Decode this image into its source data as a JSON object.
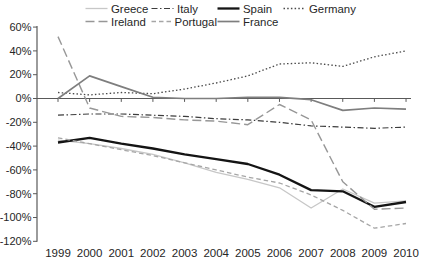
{
  "chart_data": {
    "type": "line",
    "title": "",
    "xlabel": "",
    "ylabel": "",
    "grid": false,
    "legend_position": "top",
    "ylim": [
      -120,
      60
    ],
    "y_ticks": [
      60,
      40,
      20,
      0,
      -20,
      -40,
      -60,
      -80,
      -100,
      -120
    ],
    "y_tick_suffix": "%",
    "x_categories": [
      1999,
      2000,
      2001,
      2002,
      2003,
      2004,
      2005,
      2006,
      2007,
      2008,
      2009,
      2010
    ],
    "axis_color": "#595959",
    "series": [
      {
        "name": "Greece",
        "color": "#c7c7c7",
        "dash": "",
        "width": 1.3,
        "values": [
          -35,
          -38,
          -42,
          -47,
          -54,
          -62,
          -68,
          -75,
          -92,
          -76,
          -88,
          -86
        ]
      },
      {
        "name": "Italy",
        "color": "#3d3d3d",
        "dash": "6 2.5 1.5 2.5",
        "width": 1.2,
        "values": [
          -14,
          -13,
          -13,
          -14,
          -15,
          -17,
          -18,
          -20,
          -23,
          -24,
          -25,
          -24
        ]
      },
      {
        "name": "Spain",
        "color": "#141414",
        "dash": "",
        "width": 2.3,
        "values": [
          -37,
          -33,
          -38,
          -42,
          -47,
          -51,
          -55,
          -64,
          -77,
          -78,
          -91,
          -87
        ]
      },
      {
        "name": "Germany",
        "color": "#4a4a4a",
        "dash": "1.5 2.2",
        "width": 1.3,
        "values": [
          5,
          3,
          5,
          4,
          8,
          13,
          19,
          29,
          30,
          27,
          35,
          40
        ]
      },
      {
        "name": "Ireland",
        "color": "#979797",
        "dash": "9 4",
        "width": 1.4,
        "values": [
          52,
          -8,
          -15,
          -16,
          -18,
          -19,
          -22,
          -5,
          -18,
          -70,
          -93,
          -92
        ]
      },
      {
        "name": "Portugal",
        "color": "#a6a6a6",
        "dash": "4.5 3",
        "width": 1.3,
        "values": [
          -33,
          -38,
          -43,
          -48,
          -54,
          -60,
          -66,
          -71,
          -81,
          -94,
          -109,
          -105
        ]
      },
      {
        "name": "France",
        "color": "#7e7e7e",
        "dash": "",
        "width": 1.7,
        "values": [
          0,
          19,
          10,
          1,
          0,
          0,
          1,
          1,
          -1,
          -10,
          -8,
          -9
        ]
      }
    ],
    "legend_rows": [
      [
        "Greece",
        "Italy",
        "Spain",
        "Germany"
      ],
      [
        "Ireland",
        "Portugal",
        "France"
      ]
    ]
  }
}
